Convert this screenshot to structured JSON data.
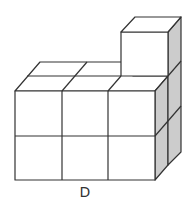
{
  "figure": {
    "label": "D",
    "colors": {
      "stroke": "#333333",
      "face": "#ffffff",
      "side_shade": "#cccccc"
    }
  }
}
